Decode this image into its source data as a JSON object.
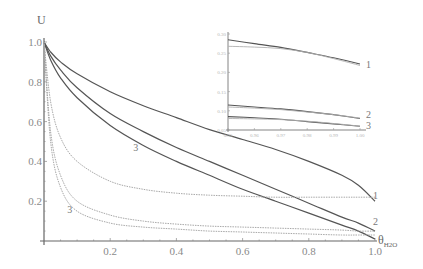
{
  "chart_data": [
    {
      "type": "line",
      "title": "",
      "xlabel": "θ",
      "xlabel_sub": "H2O",
      "ylabel": "U",
      "xlim": [
        0,
        1.0
      ],
      "ylim": [
        0,
        1.0
      ],
      "xticks": [
        "0.2",
        "0.4",
        "0.6",
        "0.8",
        "1.0"
      ],
      "yticks": [
        "0.2",
        "0.4",
        "0.6",
        "0.8",
        "1.0"
      ],
      "grid": false,
      "x": [
        0,
        0.02,
        0.05,
        0.1,
        0.2,
        0.3,
        0.4,
        0.5,
        0.6,
        0.7,
        0.8,
        0.9,
        0.95,
        1.0
      ],
      "series": [
        {
          "name": "1 (solid)",
          "style": "solid",
          "values": [
            1.0,
            0.95,
            0.9,
            0.84,
            0.75,
            0.68,
            0.62,
            0.56,
            0.51,
            0.46,
            0.4,
            0.33,
            0.28,
            0.2
          ]
        },
        {
          "name": "2 (solid)",
          "style": "solid",
          "values": [
            1.0,
            0.93,
            0.86,
            0.77,
            0.64,
            0.55,
            0.47,
            0.4,
            0.33,
            0.26,
            0.19,
            0.12,
            0.09,
            0.05
          ]
        },
        {
          "name": "3 (solid)",
          "style": "solid",
          "values": [
            1.0,
            0.91,
            0.82,
            0.72,
            0.58,
            0.48,
            0.4,
            0.33,
            0.26,
            0.2,
            0.14,
            0.08,
            0.05,
            0.01
          ]
        },
        {
          "name": "1 (dotted)",
          "style": "dotted",
          "values": [
            1.0,
            0.7,
            0.52,
            0.4,
            0.3,
            0.26,
            0.24,
            0.23,
            0.225,
            0.22,
            0.22,
            0.22,
            0.22,
            0.22
          ]
        },
        {
          "name": "2 (dotted)",
          "style": "dotted",
          "values": [
            1.0,
            0.55,
            0.33,
            0.2,
            0.13,
            0.1,
            0.085,
            0.075,
            0.07,
            0.065,
            0.06,
            0.055,
            0.05,
            0.05
          ]
        },
        {
          "name": "3 (dotted)",
          "style": "dotted",
          "values": [
            1.0,
            0.5,
            0.27,
            0.15,
            0.09,
            0.07,
            0.06,
            0.05,
            0.045,
            0.04,
            0.035,
            0.03,
            0.03,
            0.03
          ]
        }
      ],
      "annotations": [
        {
          "text": "1",
          "x": 1.0,
          "y": 0.21
        },
        {
          "text": "2",
          "x": 1.0,
          "y": 0.08
        },
        {
          "text": "3",
          "x": 0.27,
          "y": 0.45
        },
        {
          "text": "3",
          "x": 0.07,
          "y": 0.14
        }
      ]
    },
    {
      "type": "line",
      "title": "inset",
      "xlim": [
        0.95,
        1.0
      ],
      "ylim": [
        0.05,
        0.3
      ],
      "xticks": [
        "0.95",
        "0.96",
        "0.97",
        "0.98",
        "0.99",
        "1.00"
      ],
      "yticks": [
        "0.05",
        "0.10",
        "0.15",
        "0.20",
        "0.25",
        "0.30"
      ],
      "x": [
        0.95,
        0.96,
        0.97,
        0.98,
        0.99,
        1.0
      ],
      "series": [
        {
          "name": "1 (solid)",
          "values": [
            0.285,
            0.275,
            0.265,
            0.252,
            0.238,
            0.222
          ]
        },
        {
          "name": "1 (dotted)",
          "values": [
            0.268,
            0.266,
            0.262,
            0.252,
            0.236,
            0.218
          ]
        },
        {
          "name": "2 (solid)",
          "values": [
            0.115,
            0.11,
            0.105,
            0.098,
            0.09,
            0.08
          ]
        },
        {
          "name": "2 (dotted)",
          "values": [
            0.11,
            0.107,
            0.103,
            0.097,
            0.09,
            0.081
          ]
        },
        {
          "name": "3 (solid)",
          "values": [
            0.085,
            0.082,
            0.078,
            0.072,
            0.066,
            0.06
          ]
        },
        {
          "name": "3 (dotted)",
          "values": [
            0.08,
            0.079,
            0.077,
            0.073,
            0.067,
            0.06
          ]
        }
      ],
      "annotations": [
        {
          "text": "1",
          "x": 1.0,
          "y": 0.22
        },
        {
          "text": "2",
          "x": 1.0,
          "y": 0.09
        },
        {
          "text": "3",
          "x": 1.0,
          "y": 0.06
        }
      ]
    }
  ],
  "labels": {
    "y_axis": "U",
    "x_axis_main": "θ",
    "x_axis_sub": "H2O",
    "curve_1": "1",
    "curve_2": "2",
    "curve_3": "3"
  }
}
